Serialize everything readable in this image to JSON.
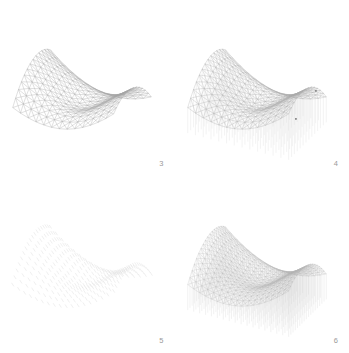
{
  "figure": {
    "background_color": "#ffffff",
    "line_color": "#8c8c8c",
    "label_color": "#9a9a9a",
    "layout": "2x2 grid of 3D surface plots",
    "panels": [
      {
        "number": "3",
        "name": "mesh-surface",
        "style": "triangulated wireframe mesh, no stems",
        "description": "Delaunay-triangulated saddle surface shown as grey wireframe mesh with curled tail at upper right"
      },
      {
        "number": "4",
        "name": "mesh-surface-with-stems",
        "style": "triangulated wireframe mesh with vertical drop lines",
        "description": "Same saddle surface wireframe with vertical stems dropping from each vertex to the base plane, plus isolated outlier marker at right"
      },
      {
        "number": "5",
        "name": "scatter-markers",
        "style": "faint scattered dash markers",
        "description": "Very light point cloud of small dash markers arranged in a curved lattice over the saddle region"
      },
      {
        "number": "6",
        "name": "dense-stem-mesh",
        "style": "dense wireframe mesh with full stem columns",
        "description": "Dense triangulated mesh with vertical stem columns filling the volume beneath the saddle surface"
      }
    ]
  },
  "chart_data": [
    {
      "type": "scatter",
      "panel": "3",
      "title": "",
      "xlabel": "",
      "ylabel": "",
      "zlabel": "",
      "projection": "3d-wireframe",
      "surface": "saddle",
      "grid": false,
      "legend": false,
      "axes_visible": false,
      "mesh_rows": 14,
      "mesh_cols": 14,
      "stems": false,
      "x": [
        -1.0,
        -0.846,
        -0.692,
        -0.538,
        -0.385,
        -0.231,
        -0.077,
        0.077,
        0.231,
        0.385,
        0.538,
        0.692,
        0.846,
        1.0
      ],
      "y": [
        -1.0,
        -0.846,
        -0.692,
        -0.538,
        -0.385,
        -0.231,
        -0.077,
        0.077,
        0.231,
        0.385,
        0.538,
        0.692,
        0.846,
        1.0
      ],
      "z_formula": "z = x^2 - y^2 scaled saddle with raised rim",
      "zlim": [
        -1.0,
        1.0
      ]
    },
    {
      "type": "scatter",
      "panel": "4",
      "title": "",
      "xlabel": "",
      "ylabel": "",
      "zlabel": "",
      "projection": "3d-wireframe",
      "surface": "saddle",
      "grid": false,
      "legend": false,
      "axes_visible": false,
      "mesh_rows": 14,
      "mesh_cols": 14,
      "stems": true,
      "stem_baseline": -1.0,
      "outlier_markers": 2,
      "x": [
        -1.0,
        -0.846,
        -0.692,
        -0.538,
        -0.385,
        -0.231,
        -0.077,
        0.077,
        0.231,
        0.385,
        0.538,
        0.692,
        0.846,
        1.0
      ],
      "y": [
        -1.0,
        -0.846,
        -0.692,
        -0.538,
        -0.385,
        -0.231,
        -0.077,
        0.077,
        0.231,
        0.385,
        0.538,
        0.692,
        0.846,
        1.0
      ],
      "z_formula": "z = x^2 - y^2 scaled saddle with raised rim",
      "zlim": [
        -1.0,
        1.0
      ]
    },
    {
      "type": "scatter",
      "panel": "5",
      "title": "",
      "xlabel": "",
      "ylabel": "",
      "zlabel": "",
      "projection": "3d-points",
      "surface": "saddle",
      "grid": false,
      "legend": false,
      "axes_visible": false,
      "mesh_rows": 18,
      "mesh_cols": 18,
      "stems": false,
      "marker": "dash",
      "marker_opacity": 0.28,
      "x": [
        -1.0,
        -0.882,
        -0.765,
        -0.647,
        -0.529,
        -0.412,
        -0.294,
        -0.176,
        -0.059,
        0.059,
        0.176,
        0.294,
        0.412,
        0.529,
        0.647,
        0.765,
        0.882,
        1.0
      ],
      "y": [
        -1.0,
        -0.882,
        -0.765,
        -0.647,
        -0.529,
        -0.412,
        -0.294,
        -0.176,
        -0.059,
        0.059,
        0.176,
        0.294,
        0.412,
        0.529,
        0.647,
        0.765,
        0.882,
        1.0
      ],
      "z_formula": "z = x^2 - y^2 scaled saddle with raised rim",
      "zlim": [
        -1.0,
        1.0
      ]
    },
    {
      "type": "scatter",
      "panel": "6",
      "title": "",
      "xlabel": "",
      "ylabel": "",
      "zlabel": "",
      "projection": "3d-wireframe",
      "surface": "saddle",
      "grid": false,
      "legend": false,
      "axes_visible": false,
      "mesh_rows": 18,
      "mesh_cols": 18,
      "stems": true,
      "stem_density": "full",
      "stem_baseline": -1.0,
      "x": [
        -1.0,
        -0.882,
        -0.765,
        -0.647,
        -0.529,
        -0.412,
        -0.294,
        -0.176,
        -0.059,
        0.059,
        0.176,
        0.294,
        0.412,
        0.529,
        0.647,
        0.765,
        0.882,
        1.0
      ],
      "y": [
        -1.0,
        -0.882,
        -0.765,
        -0.647,
        -0.529,
        -0.412,
        -0.294,
        -0.176,
        -0.059,
        0.059,
        0.176,
        0.294,
        0.412,
        0.529,
        0.647,
        0.765,
        0.882,
        1.0
      ],
      "z_formula": "z = x^2 - y^2 scaled saddle with raised rim",
      "zlim": [
        -1.0,
        1.0
      ]
    }
  ]
}
